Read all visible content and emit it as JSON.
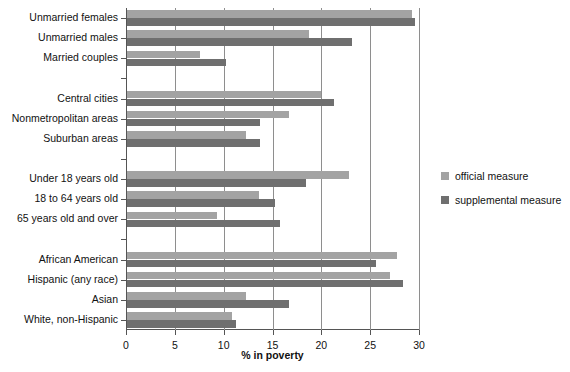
{
  "chart_data": {
    "type": "bar",
    "orientation": "horizontal",
    "title": "",
    "xlabel": "% in poverty",
    "ylabel": "",
    "xlim": [
      0,
      30
    ],
    "xticks": [
      0,
      5,
      10,
      15,
      20,
      25,
      30
    ],
    "xtick_labels": [
      "0",
      "5",
      "10",
      "15",
      "20",
      "25",
      "30"
    ],
    "grid": "vertical",
    "legend_position": "right",
    "colors": {
      "official": "#a3a3a3",
      "supplemental": "#6f6f6f",
      "axis": "#555555",
      "grid": "#8e8e8e",
      "background": "#ffffff"
    },
    "series": [
      {
        "name": "official measure",
        "key": "official"
      },
      {
        "name": "supplemental measure",
        "key": "supplemental"
      }
    ],
    "groups": [
      {
        "name": "family-type",
        "categories": [
          {
            "label": "Unmarried females",
            "official": 29.2,
            "supplemental": 29.5
          },
          {
            "label": "Unmarried males",
            "official": 18.6,
            "supplemental": 23.0
          },
          {
            "label": "Married couples",
            "official": 7.5,
            "supplemental": 10.1
          }
        ]
      },
      {
        "name": "residence",
        "categories": [
          {
            "label": "Central cities",
            "official": 19.9,
            "supplemental": 21.2
          },
          {
            "label": "Nonmetropolitan areas",
            "official": 16.6,
            "supplemental": 13.6
          },
          {
            "label": "Suburban areas",
            "official": 12.2,
            "supplemental": 13.6
          }
        ]
      },
      {
        "name": "age",
        "categories": [
          {
            "label": "Under 18 years old",
            "official": 22.7,
            "supplemental": 18.3
          },
          {
            "label": "18 to 64 years old",
            "official": 13.5,
            "supplemental": 15.2
          },
          {
            "label": "65 years old and over",
            "official": 9.2,
            "supplemental": 15.7
          }
        ]
      },
      {
        "name": "race-ethnicity",
        "categories": [
          {
            "label": "African American",
            "official": 27.6,
            "supplemental": 25.5
          },
          {
            "label": "Hispanic (any race)",
            "official": 26.9,
            "supplemental": 28.3
          },
          {
            "label": "Asian",
            "official": 12.2,
            "supplemental": 16.6
          },
          {
            "label": "White, non-Hispanic",
            "official": 10.7,
            "supplemental": 11.2
          }
        ]
      }
    ]
  },
  "legend": {
    "items": [
      {
        "label": "official measure",
        "key": "official"
      },
      {
        "label": "supplemental measure",
        "key": "supplemental"
      }
    ]
  }
}
